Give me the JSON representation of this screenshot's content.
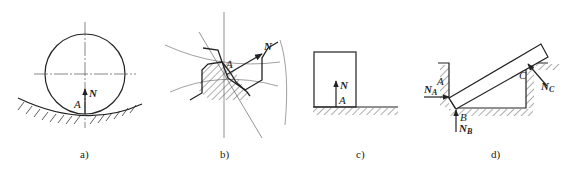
{
  "figure": {
    "panels": [
      {
        "id": "a",
        "caption": "a)",
        "description": "Cylinder resting on concave curved surface",
        "labels": {
          "point": "A",
          "force": "N"
        }
      },
      {
        "id": "b",
        "caption": "b)",
        "description": "Meshing gear teeth with contact normal force",
        "labels": {
          "point": "A",
          "force": "N"
        }
      },
      {
        "id": "c",
        "caption": "c)",
        "description": "Block resting on flat surface",
        "labels": {
          "point": "A",
          "force": "N"
        }
      },
      {
        "id": "d",
        "caption": "d)",
        "description": "Bar resting in a groove with three contact points",
        "labels": {
          "point_a": "A",
          "point_b": "B",
          "point_c": "C",
          "force_a": "N",
          "force_a_sub": "A",
          "force_b": "N",
          "force_b_sub": "B",
          "force_c": "N",
          "force_c_sub": "C"
        }
      }
    ]
  },
  "colors": {
    "line": "#222222",
    "thin": "#555555"
  }
}
